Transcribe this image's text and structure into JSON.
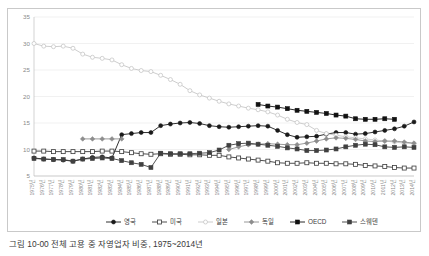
{
  "caption": "그림 10-00  전체 고용 중 자영업자 비중, 1975~2014년",
  "chart_data": {
    "type": "line",
    "title": "",
    "xlabel": "",
    "ylabel": "",
    "ylim": [
      5,
      35
    ],
    "yticks": [
      5,
      10,
      15,
      20,
      25,
      30,
      35
    ],
    "grid": true,
    "legend_position": "bottom",
    "x": [
      "1975년",
      "1976년",
      "1977년",
      "1978년",
      "1979년",
      "1980년",
      "1981년",
      "1982년",
      "1983년",
      "1984년",
      "1985년",
      "1986년",
      "1987년",
      "1988년",
      "1989년",
      "1990년",
      "1991년",
      "1992년",
      "1993년",
      "1994년",
      "1995년",
      "1996년",
      "1997년",
      "1998년",
      "1999년",
      "2000년",
      "2001년",
      "2002년",
      "2003년",
      "2004년",
      "2005년",
      "2006년",
      "2007년",
      "2008년",
      "2009년",
      "2010년",
      "2011년",
      "2012년",
      "2013년",
      "2014년"
    ],
    "series": [
      {
        "name": "영국",
        "color": "#1a1a1a",
        "marker": "circle-filled",
        "values": [
          8.4,
          8.2,
          8.1,
          8.0,
          7.8,
          8.2,
          8.5,
          8.6,
          8.4,
          12.8,
          13.0,
          13.2,
          13.2,
          14.5,
          14.8,
          15.0,
          15.1,
          14.9,
          14.5,
          14.3,
          14.2,
          14.3,
          14.4,
          14.5,
          14.4,
          13.6,
          12.8,
          12.3,
          12.4,
          12.5,
          12.9,
          13.2,
          13.2,
          12.9,
          13.0,
          13.3,
          13.6,
          13.9,
          14.4,
          15.2
        ]
      },
      {
        "name": "미국",
        "color": "#3a3a3a",
        "marker": "square-open",
        "values": [
          9.7,
          9.7,
          9.6,
          9.6,
          9.6,
          9.6,
          9.6,
          9.7,
          9.7,
          9.6,
          9.4,
          9.2,
          9.1,
          9.2,
          9.1,
          9.1,
          9.0,
          9.0,
          8.9,
          8.9,
          8.6,
          8.4,
          8.2,
          8.0,
          7.8,
          7.5,
          7.4,
          7.4,
          7.5,
          7.4,
          7.4,
          7.3,
          7.3,
          7.2,
          7.0,
          6.9,
          6.8,
          6.6,
          6.5,
          6.5
        ]
      },
      {
        "name": "일본",
        "color": "#c7c7c7",
        "marker": "circle-open",
        "values": [
          30.0,
          29.5,
          29.4,
          29.5,
          29.1,
          28.0,
          27.4,
          27.2,
          26.9,
          26.0,
          25.3,
          24.9,
          24.7,
          24.0,
          23.2,
          22.3,
          21.1,
          20.3,
          19.7,
          19.1,
          18.6,
          18.2,
          17.8,
          17.5,
          17.1,
          16.5,
          15.7,
          15.1,
          14.7,
          13.6,
          13.0,
          12.7,
          12.4,
          12.2,
          12.0,
          11.8,
          11.6,
          11.4,
          11.2,
          11.1
        ]
      },
      {
        "name": "독일",
        "color": "#8d8d8d",
        "marker": "diamond-filled",
        "values": [
          null,
          null,
          null,
          null,
          null,
          12.0,
          12.0,
          12.0,
          12.0,
          12.0,
          null,
          null,
          null,
          null,
          null,
          null,
          null,
          null,
          null,
          null,
          10.0,
          10.5,
          10.9,
          11.0,
          11.1,
          11.0,
          10.9,
          10.9,
          11.2,
          11.6,
          12.0,
          12.2,
          12.1,
          11.9,
          11.6,
          11.5,
          11.6,
          11.6,
          11.4,
          11.2
        ]
      },
      {
        "name": "OECD",
        "color": "#111111",
        "marker": "square-filled",
        "values": [
          null,
          null,
          null,
          null,
          null,
          null,
          null,
          null,
          null,
          null,
          null,
          null,
          null,
          null,
          null,
          null,
          null,
          null,
          null,
          null,
          null,
          null,
          null,
          18.5,
          18.2,
          18.0,
          17.7,
          17.4,
          17.2,
          17.0,
          16.8,
          16.5,
          16.3,
          15.8,
          15.7,
          15.7,
          15.8,
          15.7,
          null,
          null
        ]
      },
      {
        "name": "스웨덴",
        "color": "#404040",
        "marker": "square-filled",
        "values": [
          8.3,
          8.2,
          8.1,
          8.1,
          7.8,
          8.2,
          8.3,
          8.4,
          8.3,
          7.9,
          7.5,
          7.2,
          6.6,
          9.3,
          9.2,
          9.2,
          9.2,
          9.3,
          9.4,
          9.9,
          10.8,
          11.1,
          11.2,
          11.0,
          10.8,
          10.6,
          10.3,
          10.1,
          9.8,
          9.8,
          9.9,
          10.1,
          10.5,
          10.8,
          11.0,
          10.9,
          10.5,
          10.4,
          10.5,
          10.4
        ]
      }
    ]
  }
}
